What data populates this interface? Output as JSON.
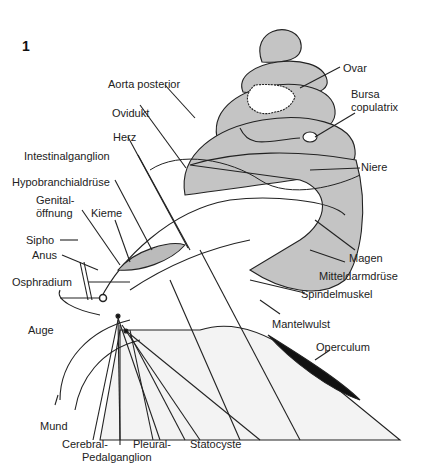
{
  "figure_number": "1",
  "labels": {
    "aorta_posterior": "Aorta posterior",
    "ovidukt": "Ovidukt",
    "herz": "Herz",
    "intestinalganglion": "Intestinalganglion",
    "hypobranchialdruese": "Hypobranchialdrüse",
    "genital_1": "Genital-",
    "genital_2": "öffnung",
    "kieme": "Kieme",
    "sipho": "Sipho",
    "anus": "Anus",
    "osphradium": "Osphradium",
    "auge": "Auge",
    "mund": "Mund",
    "cerebral": "Cerebral-",
    "pleural": "Pleural-",
    "pedalganglion": "Pedalganglion",
    "statocyste": "Statocyste",
    "ovar": "Ovar",
    "bursa_1": "Bursa",
    "bursa_2": "copulatrix",
    "niere": "Niere",
    "magen": "Magen",
    "mitteldarmdruese": "Mitteldarmdrüse",
    "spindelmuskel": "Spindelmuskel",
    "mantelwulst": "Mantelwulst",
    "operculum": "Operculum"
  },
  "colors": {
    "shell": "#c4c4c4",
    "line": "#222222",
    "operculum": "#111111"
  }
}
